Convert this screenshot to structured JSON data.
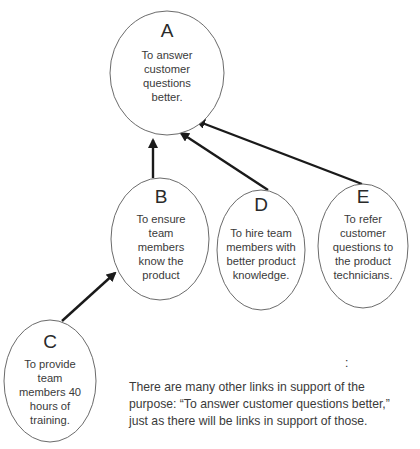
{
  "diagram": {
    "nodes": [
      {
        "id": "A",
        "letter": "A",
        "text": "To answer\ncustomer\nquestions\nbetter."
      },
      {
        "id": "B",
        "letter": "B",
        "text": "To ensure\nteam\nmembers\nknow the\nproduct"
      },
      {
        "id": "C",
        "letter": "C",
        "text": "To provide\nteam\nmembers 40\nhours of\ntraining."
      },
      {
        "id": "D",
        "letter": "D",
        "text": "To hire team\nmembers with\nbetter product\nknowledge."
      },
      {
        "id": "E",
        "letter": "E",
        "text": "To refer\ncustomer\nquestions to\nthe product\ntechnicians."
      }
    ],
    "edges": [
      {
        "from": "B",
        "to": "A"
      },
      {
        "from": "D",
        "to": "A"
      },
      {
        "from": "E",
        "to": "A"
      },
      {
        "from": "C",
        "to": "B"
      }
    ],
    "caption": "There are many other links in support of the\npurpose: “To answer customer questions better,”\njust as there will be links in support of those.",
    "stray_mark": ":",
    "colors": {
      "ellipse_stroke": "#6b6b6b",
      "arrow": "#1a1a1a",
      "text": "#3a3a3a"
    }
  }
}
